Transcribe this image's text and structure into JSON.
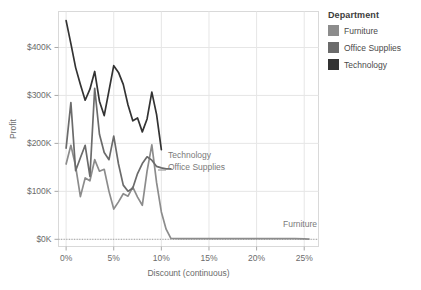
{
  "legend": {
    "title": "Department",
    "items": [
      {
        "label": "Furniture",
        "color": "#8c8c8c"
      },
      {
        "label": "Office Supplies",
        "color": "#6b6b6b"
      },
      {
        "label": "Technology",
        "color": "#333333"
      }
    ]
  },
  "annotations": [
    {
      "name": "technology-annotation",
      "text": "Technology",
      "x": 168,
      "y": 158
    },
    {
      "name": "office-supplies-annotation",
      "text": "Office Supplies",
      "x": 168,
      "y": 170
    },
    {
      "name": "furniture-annotation",
      "text": "Furniture",
      "x": 283,
      "y": 227
    }
  ],
  "axis": {
    "x_title": "Discount (continuous)",
    "y_title": "Profit",
    "x_ticks": [
      "0%",
      "5%",
      "10%",
      "15%",
      "20%",
      "25%"
    ],
    "y_ticks": [
      "$0K",
      "$100K",
      "$200K",
      "$300K",
      "$400K"
    ]
  },
  "chart_data": {
    "type": "line",
    "title": "",
    "xlabel": "Discount (continuous)",
    "ylabel": "Profit",
    "xlim": [
      -0.8,
      26.5
    ],
    "ylim": [
      -15000,
      475000
    ],
    "x_ticks": [
      0,
      5,
      10,
      15,
      20,
      25
    ],
    "x_tick_labels": [
      "0%",
      "5%",
      "10%",
      "15%",
      "20%",
      "25%"
    ],
    "y_ticks": [
      0,
      100000,
      200000,
      300000,
      400000
    ],
    "y_tick_labels": [
      "$0K",
      "$100K",
      "$200K",
      "$300K",
      "$400K"
    ],
    "grid": true,
    "zero_reference_line": true,
    "legend_position": "right",
    "series": [
      {
        "name": "Furniture",
        "color": "#8c8c8c",
        "x": [
          0,
          0.5,
          1,
          1.5,
          2,
          2.5,
          3,
          3.5,
          4,
          4.5,
          5,
          5.5,
          6,
          6.5,
          7,
          7.5,
          8,
          8.5,
          9,
          9.5,
          10,
          10.5,
          11,
          12,
          13,
          14,
          15,
          16,
          17,
          18,
          19,
          20,
          21,
          22,
          23,
          24,
          25,
          25.5
        ],
        "y": [
          157000,
          196000,
          152000,
          89000,
          128000,
          122000,
          166000,
          142000,
          146000,
          100000,
          63000,
          78000,
          95000,
          90000,
          109000,
          88000,
          71000,
          142000,
          197000,
          118000,
          57000,
          21000,
          2000,
          1500,
          1500,
          1500,
          1500,
          1500,
          1500,
          1500,
          1500,
          1500,
          1500,
          1500,
          1500,
          1500,
          1000,
          500
        ]
      },
      {
        "name": "Office Supplies",
        "color": "#6b6b6b",
        "x": [
          0,
          0.5,
          1,
          1.5,
          2,
          2.5,
          3,
          3.5,
          4,
          4.5,
          5,
          5.5,
          6,
          6.5,
          7,
          7.5,
          8,
          8.5,
          9,
          9.5,
          10,
          10.5,
          11
        ],
        "y": [
          190000,
          285000,
          143000,
          170000,
          196000,
          131000,
          315000,
          219000,
          181000,
          166000,
          215000,
          157000,
          113000,
          100000,
          107000,
          137000,
          158000,
          172000,
          165000,
          152000,
          149000,
          147000,
          147000
        ]
      },
      {
        "name": "Technology",
        "color": "#333333",
        "x": [
          0,
          0.5,
          1,
          1.5,
          2,
          2.5,
          3,
          3.5,
          4,
          4.5,
          5,
          5.5,
          6,
          6.5,
          7,
          7.5,
          8,
          8.5,
          9,
          9.5,
          10
        ],
        "y": [
          456000,
          408000,
          358000,
          323000,
          290000,
          313000,
          350000,
          288000,
          258000,
          310000,
          362000,
          348000,
          323000,
          280000,
          247000,
          253000,
          224000,
          251000,
          307000,
          260000,
          187000
        ]
      }
    ]
  }
}
